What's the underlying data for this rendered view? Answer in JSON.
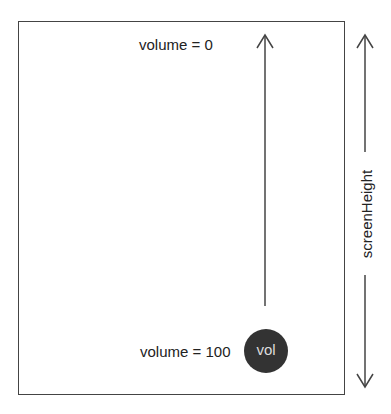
{
  "diagram": {
    "screen": {
      "top_label": "volume = 0",
      "bottom_label": "volume = 100"
    },
    "knob": {
      "label": "vol",
      "color": "#333333",
      "text_color": "#dddddd"
    },
    "dimension": {
      "label": "screenHeight"
    },
    "colors": {
      "stroke": "#444444",
      "text": "#222222",
      "background": "#ffffff"
    }
  }
}
